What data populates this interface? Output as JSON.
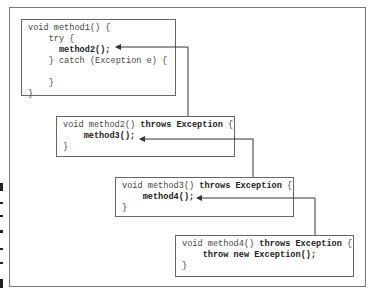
{
  "diagram": {
    "boxes": [
      {
        "id": "method1",
        "lines": [
          [
            {
              "t": "void method1() {",
              "b": false
            }
          ],
          [
            {
              "t": "    try {",
              "b": false
            }
          ],
          [
            {
              "t": "      ",
              "b": false
            },
            {
              "t": "method2();",
              "b": true
            }
          ],
          [
            {
              "t": "    } catch (Exception e) {",
              "b": false
            }
          ],
          [
            {
              "t": "",
              "b": false
            }
          ],
          [
            {
              "t": "    }",
              "b": false
            }
          ],
          [
            {
              "t": "}",
              "b": false
            }
          ]
        ]
      },
      {
        "id": "method2",
        "lines": [
          [
            {
              "t": "void method2() ",
              "b": false
            },
            {
              "t": "throws Exception",
              "b": true
            },
            {
              "t": " {",
              "b": false
            }
          ],
          [
            {
              "t": "    ",
              "b": false
            },
            {
              "t": "method3();",
              "b": true
            }
          ],
          [
            {
              "t": "}",
              "b": false
            }
          ]
        ]
      },
      {
        "id": "method3",
        "lines": [
          [
            {
              "t": "void method3() ",
              "b": false
            },
            {
              "t": "throws Exception",
              "b": true
            },
            {
              "t": " {",
              "b": false
            }
          ],
          [
            {
              "t": "    ",
              "b": false
            },
            {
              "t": "method4();",
              "b": true
            }
          ],
          [
            {
              "t": "}",
              "b": false
            }
          ]
        ]
      },
      {
        "id": "method4",
        "lines": [
          [
            {
              "t": "void method4() ",
              "b": false
            },
            {
              "t": "throws Exception",
              "b": true
            },
            {
              "t": " {",
              "b": false
            }
          ],
          [
            {
              "t": "    ",
              "b": false
            },
            {
              "t": "throw new Exception();",
              "b": true
            }
          ],
          [
            {
              "t": "}",
              "b": false
            }
          ]
        ]
      }
    ],
    "arrows": [
      {
        "from": "method2",
        "to": "method1.method2-call"
      },
      {
        "from": "method3",
        "to": "method2.method3-call"
      },
      {
        "from": "method4",
        "to": "method3.method4-call"
      }
    ],
    "colors": {
      "border": "#666666",
      "arrow": "#333333",
      "text": "#444444"
    }
  }
}
